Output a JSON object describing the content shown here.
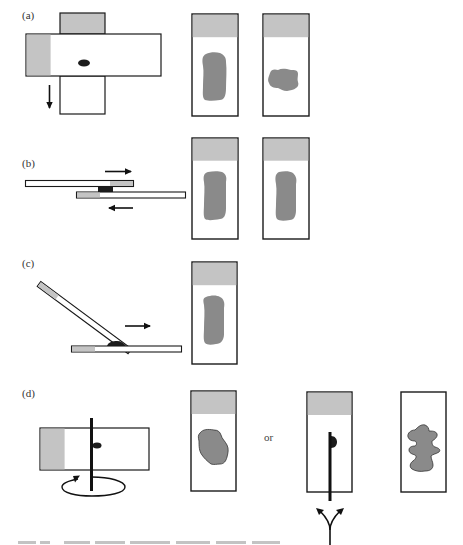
{
  "figure": {
    "panels": [
      {
        "label": "(a)",
        "description": "Crossed slides pulled apart (touch/squash method)",
        "results_count": 2
      },
      {
        "label": "(b)",
        "description": "Two slides sliding past each other in opposite directions (squash/smear)",
        "results_count": 2
      },
      {
        "label": "(c)",
        "description": "Tilted slide pushed across base slide (smear/spread)",
        "results_count": 1
      },
      {
        "label": "(d)",
        "description": "Rotating rod / rolling method with alternative outcomes",
        "results_count": 3,
        "alternative_word": "or"
      }
    ],
    "colors": {
      "outline": "#1a1a1a",
      "frosted_end": "#c4c4c4",
      "specimen_smear": "#8a8a8a",
      "specimen_dark": "#1c1c1c",
      "background": "#ffffff"
    }
  }
}
